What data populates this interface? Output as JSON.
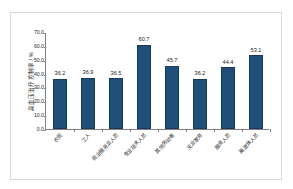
{
  "chart_data": {
    "type": "bar",
    "title": "",
    "xlabel": "",
    "ylabel": "高血压治疗控制率 / %",
    "ylim": [
      0,
      70
    ],
    "ytick_step": 10,
    "ytick_labels": [
      "0.0",
      "10.0",
      "20.0",
      "30.0",
      "40.0",
      "50.0",
      "60.0",
      "70.0"
    ],
    "ytick_values": [
      0,
      10,
      20,
      30,
      40,
      50,
      60,
      70
    ],
    "grid": false,
    "legend": false,
    "bar_color": "#1F4E79",
    "axis_color": "#808080",
    "categories": [
      "农民",
      "工人",
      "商业服务业人员",
      "专业技术人员",
      "其他劳动者",
      "无业家务",
      "服务人员",
      "离退休人员"
    ],
    "values": [
      36.2,
      36.9,
      36.5,
      60.7,
      45.7,
      36.2,
      44.4,
      53.1
    ],
    "value_labels": [
      "36.2",
      "36.9",
      "36.5",
      "60.7",
      "45.7",
      "36.2",
      "44.4",
      "53.1"
    ]
  }
}
